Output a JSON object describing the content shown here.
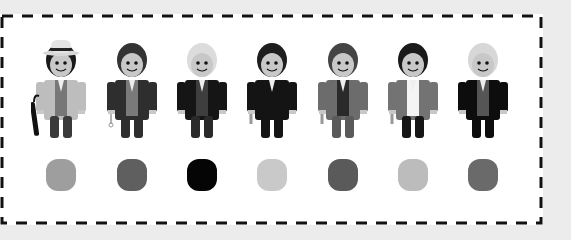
{
  "figures": [
    {
      "name": "figure-1",
      "cx": 61,
      "hat": true,
      "hair": "#1a1a1a",
      "coat": "#bdbdbd",
      "vest": "#777777",
      "pants": "#3a3a3a",
      "accessory": "umbrella",
      "swatch": "#9e9e9e"
    },
    {
      "name": "figure-2",
      "cx": 132,
      "hat": false,
      "hair": "#333333",
      "coat": "#2e2e2e",
      "vest": "#7a7a7a",
      "pants": "#2e2e2e",
      "accessory": "pocketwatch",
      "swatch": "#5f5f5f"
    },
    {
      "name": "figure-3",
      "cx": 202,
      "hat": false,
      "hair": "#dcdcdc",
      "coat": "#151515",
      "vest": "#3e3e3e",
      "pants": "#2a2a2a",
      "accessory": "none",
      "swatch": "#050505"
    },
    {
      "name": "figure-4",
      "cx": 272,
      "hat": false,
      "hair": "#1e1e1e",
      "coat": "#141414",
      "vest": "#141414",
      "pants": "#141414",
      "accessory": "screwdriver",
      "swatch": "#c9c9c9"
    },
    {
      "name": "figure-5",
      "cx": 343,
      "hat": false,
      "hair": "#444444",
      "coat": "#6c6c6c",
      "vest": "#2a2a2a",
      "pants": "#5a5a5a",
      "accessory": "screwdriver",
      "swatch": "#5a5a5a"
    },
    {
      "name": "figure-6",
      "cx": 413,
      "hat": false,
      "hair": "#1a1a1a",
      "coat": "#737373",
      "vest": "#f4f4f4",
      "pants": "#161616",
      "accessory": "screwdriver",
      "swatch": "#bcbcbc"
    },
    {
      "name": "figure-7",
      "cx": 483,
      "hat": false,
      "hair": "#d7d7d7",
      "coat": "#0d0d0d",
      "vest": "#555555",
      "pants": "#0d0d0d",
      "accessory": "none",
      "swatch": "#6a6a6a"
    }
  ],
  "colors": {
    "background": "#ececec",
    "panel": "#ffffff",
    "dash": "#111111",
    "skin": "#c8c8c8"
  }
}
